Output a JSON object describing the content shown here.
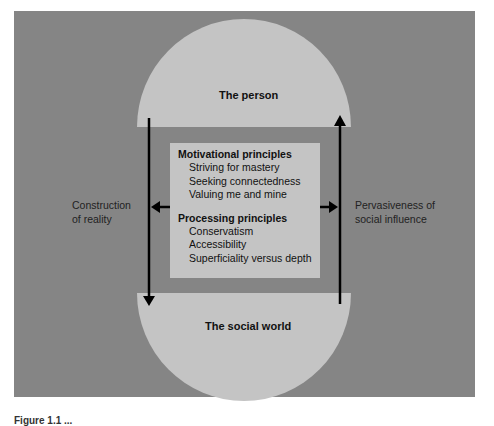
{
  "diagram": {
    "top_node": {
      "label": "The person"
    },
    "bottom_node": {
      "label": "The social world"
    },
    "center_box": {
      "sections": [
        {
          "heading": "Motivational principles",
          "items": [
            "Striving for mastery",
            "Seeking connectedness",
            "Valuing me and mine"
          ]
        },
        {
          "heading": "Processing principles",
          "items": [
            "Conservatism",
            "Accessibility",
            "Superficiality versus depth"
          ]
        }
      ]
    },
    "left_arrow": {
      "label_line1": "Construction",
      "label_line2": "of reality",
      "direction": "down"
    },
    "right_arrow": {
      "label_line1": "Pervasiveness of",
      "label_line2": "social influence",
      "direction": "up"
    },
    "colors": {
      "panel": "#858585",
      "shapes": "#c4c4c4",
      "arrows": "#000000"
    }
  },
  "caption": {
    "text": "Figure 1.1 ..."
  }
}
